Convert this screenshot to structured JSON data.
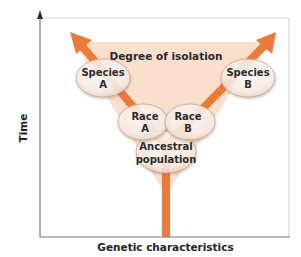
{
  "diagram": {
    "y_axis_label": "Time",
    "x_axis_label": "Genetic characteristics",
    "triangle_label": "Degree of isolation",
    "nodes": [
      {
        "id": "ancestral",
        "line1": "Ancestral",
        "line2": "population"
      },
      {
        "id": "race_a",
        "line1": "Race",
        "line2": "A"
      },
      {
        "id": "race_b",
        "line1": "Race",
        "line2": "B"
      },
      {
        "id": "species_a",
        "line1": "Species",
        "line2": "A"
      },
      {
        "id": "species_b",
        "line1": "Species",
        "line2": "B"
      }
    ],
    "colors": {
      "arrow": "#ee7a3a",
      "triangle_fill": "#f9dcc8",
      "ellipse_fill": "#fdf6f0",
      "ellipse_stroke": "#c9a58c",
      "axis": "#777777",
      "frame": "#cfcfcf"
    }
  }
}
